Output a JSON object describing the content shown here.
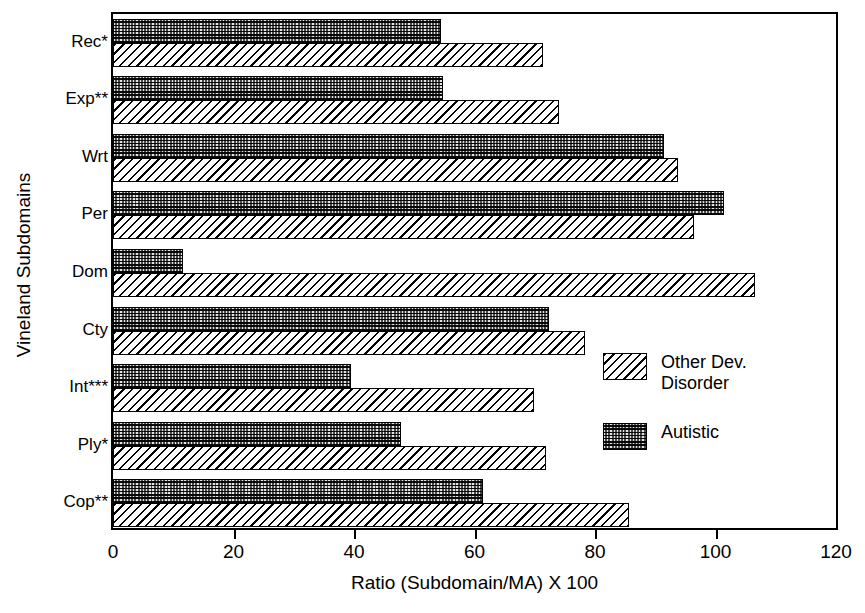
{
  "chart_data": {
    "type": "bar",
    "orientation": "horizontal",
    "title": "",
    "xlabel": "Ratio (Subdomain/MA) X 100",
    "ylabel": "Vineland Subdomains",
    "xlim": [
      0,
      120
    ],
    "xticks": [
      0,
      20,
      40,
      60,
      80,
      100,
      120
    ],
    "xticklabels": [
      "0",
      "20",
      "40",
      "60",
      "80",
      "100",
      "120"
    ],
    "grid": false,
    "legend_position": "center-right",
    "categories": [
      "Rec*",
      "Exp**",
      "Wrt",
      "Per",
      "Dom",
      "Cty",
      "Int***",
      "Ply*",
      "Cop**"
    ],
    "series": [
      {
        "name": "Other Dev. Disorder",
        "pattern": "diagonal-hatch",
        "values": [
          71.3,
          74.1,
          93.8,
          96.4,
          106.6,
          78.3,
          69.9,
          71.8,
          85.7
        ]
      },
      {
        "name": "Autistic",
        "pattern": "dark-stipple",
        "values": [
          54.5,
          54.7,
          91.5,
          101.4,
          11.7,
          72.4,
          39.5,
          47.8,
          61.4
        ]
      }
    ]
  },
  "legend": {
    "entries": [
      {
        "label": "Other Dev.\nDisorder",
        "swatch": "diagonal-hatch"
      },
      {
        "label": "Autistic",
        "swatch": "dark-stipple"
      }
    ]
  },
  "axes": {
    "y_title": "Vineland Subdomains",
    "x_title": "Ratio (Subdomain/MA) X 100"
  },
  "colors": {
    "axis": "#000000",
    "hatch_fill": "#ffffff",
    "hatch_line": "#000000",
    "stipple_fill": "#4a4a4a",
    "background": "#ffffff"
  }
}
